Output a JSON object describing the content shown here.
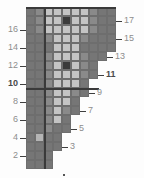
{
  "chart_data": {
    "type": "heatmap",
    "title": "",
    "xlabel": "",
    "ylabel": "",
    "grid": {
      "columns": 10,
      "rows": 18,
      "cell_px": 9,
      "origin_x": 26,
      "origin_y": 7
    },
    "palette": {
      "dark": "#3a3a3a",
      "mid_dark": "#767676",
      "mid": "#8a8a8a",
      "light": "#b4b4b4",
      "pale": "#c4c4c4",
      "empty": "#ffffff",
      "gridline": "#6e6e6e",
      "heavy_line": "#3a3a3a",
      "label": "#8d8d8d",
      "label_bold": "#4a4a4a"
    },
    "row_widths": [
      3,
      3,
      4,
      4,
      5,
      5,
      6,
      6,
      7,
      7,
      8,
      8,
      9,
      10,
      10,
      10,
      10,
      10
    ],
    "cells": [
      {
        "r": 18,
        "c": 1,
        "v": "mid_dark"
      },
      {
        "r": 18,
        "c": 2,
        "v": "mid"
      },
      {
        "r": 18,
        "c": 3,
        "v": "pale"
      },
      {
        "r": 18,
        "c": 4,
        "v": "pale"
      },
      {
        "r": 18,
        "c": 5,
        "v": "pale"
      },
      {
        "r": 18,
        "c": 6,
        "v": "pale"
      },
      {
        "r": 18,
        "c": 7,
        "v": "pale"
      },
      {
        "r": 18,
        "c": 8,
        "v": "mid"
      },
      {
        "r": 18,
        "c": 9,
        "v": "mid_dark"
      },
      {
        "r": 18,
        "c": 10,
        "v": "mid_dark"
      },
      {
        "r": 17,
        "c": 1,
        "v": "mid_dark"
      },
      {
        "r": 17,
        "c": 2,
        "v": "mid"
      },
      {
        "r": 17,
        "c": 3,
        "v": "pale"
      },
      {
        "r": 17,
        "c": 4,
        "v": "pale"
      },
      {
        "r": 17,
        "c": 5,
        "v": "dark"
      },
      {
        "r": 17,
        "c": 6,
        "v": "pale"
      },
      {
        "r": 17,
        "c": 7,
        "v": "pale"
      },
      {
        "r": 17,
        "c": 8,
        "v": "mid"
      },
      {
        "r": 17,
        "c": 9,
        "v": "mid_dark"
      },
      {
        "r": 17,
        "c": 10,
        "v": "mid_dark"
      },
      {
        "r": 16,
        "c": 1,
        "v": "mid_dark"
      },
      {
        "r": 16,
        "c": 2,
        "v": "mid"
      },
      {
        "r": 16,
        "c": 3,
        "v": "pale"
      },
      {
        "r": 16,
        "c": 4,
        "v": "pale"
      },
      {
        "r": 16,
        "c": 5,
        "v": "pale"
      },
      {
        "r": 16,
        "c": 6,
        "v": "pale"
      },
      {
        "r": 16,
        "c": 7,
        "v": "pale"
      },
      {
        "r": 16,
        "c": 8,
        "v": "mid"
      },
      {
        "r": 16,
        "c": 9,
        "v": "mid_dark"
      },
      {
        "r": 16,
        "c": 10,
        "v": "mid_dark"
      },
      {
        "r": 15,
        "c": 1,
        "v": "mid_dark"
      },
      {
        "r": 15,
        "c": 2,
        "v": "mid_dark"
      },
      {
        "r": 15,
        "c": 3,
        "v": "mid"
      },
      {
        "r": 15,
        "c": 4,
        "v": "pale"
      },
      {
        "r": 15,
        "c": 5,
        "v": "pale"
      },
      {
        "r": 15,
        "c": 6,
        "v": "pale"
      },
      {
        "r": 15,
        "c": 7,
        "v": "mid"
      },
      {
        "r": 15,
        "c": 8,
        "v": "mid_dark"
      },
      {
        "r": 15,
        "c": 9,
        "v": "mid_dark"
      },
      {
        "r": 15,
        "c": 10,
        "v": "mid_dark"
      },
      {
        "r": 14,
        "c": 1,
        "v": "mid_dark"
      },
      {
        "r": 14,
        "c": 2,
        "v": "mid_dark"
      },
      {
        "r": 14,
        "c": 3,
        "v": "mid_dark"
      },
      {
        "r": 14,
        "c": 4,
        "v": "pale"
      },
      {
        "r": 14,
        "c": 5,
        "v": "pale"
      },
      {
        "r": 14,
        "c": 6,
        "v": "pale"
      },
      {
        "r": 14,
        "c": 7,
        "v": "mid_dark"
      },
      {
        "r": 14,
        "c": 8,
        "v": "mid_dark"
      },
      {
        "r": 14,
        "c": 9,
        "v": "mid_dark"
      },
      {
        "r": 14,
        "c": 10,
        "v": "mid_dark"
      },
      {
        "r": 13,
        "c": 1,
        "v": "mid_dark"
      },
      {
        "r": 13,
        "c": 2,
        "v": "mid_dark"
      },
      {
        "r": 13,
        "c": 3,
        "v": "mid"
      },
      {
        "r": 13,
        "c": 4,
        "v": "pale"
      },
      {
        "r": 13,
        "c": 5,
        "v": "pale"
      },
      {
        "r": 13,
        "c": 6,
        "v": "pale"
      },
      {
        "r": 13,
        "c": 7,
        "v": "mid"
      },
      {
        "r": 13,
        "c": 8,
        "v": "mid_dark"
      },
      {
        "r": 13,
        "c": 9,
        "v": "mid_dark"
      },
      {
        "r": 12,
        "c": 1,
        "v": "mid_dark"
      },
      {
        "r": 12,
        "c": 2,
        "v": "mid_dark"
      },
      {
        "r": 12,
        "c": 3,
        "v": "mid"
      },
      {
        "r": 12,
        "c": 4,
        "v": "pale"
      },
      {
        "r": 12,
        "c": 5,
        "v": "dark"
      },
      {
        "r": 12,
        "c": 6,
        "v": "pale"
      },
      {
        "r": 12,
        "c": 7,
        "v": "mid"
      },
      {
        "r": 12,
        "c": 8,
        "v": "mid_dark"
      },
      {
        "r": 11,
        "c": 1,
        "v": "mid_dark"
      },
      {
        "r": 11,
        "c": 2,
        "v": "mid_dark"
      },
      {
        "r": 11,
        "c": 3,
        "v": "mid"
      },
      {
        "r": 11,
        "c": 4,
        "v": "pale"
      },
      {
        "r": 11,
        "c": 5,
        "v": "pale"
      },
      {
        "r": 11,
        "c": 6,
        "v": "pale"
      },
      {
        "r": 11,
        "c": 7,
        "v": "mid"
      },
      {
        "r": 11,
        "c": 8,
        "v": "mid_dark"
      },
      {
        "r": 10,
        "c": 1,
        "v": "mid_dark"
      },
      {
        "r": 10,
        "c": 2,
        "v": "mid_dark"
      },
      {
        "r": 10,
        "c": 3,
        "v": "mid"
      },
      {
        "r": 10,
        "c": 4,
        "v": "pale"
      },
      {
        "r": 10,
        "c": 5,
        "v": "pale"
      },
      {
        "r": 10,
        "c": 6,
        "v": "pale"
      },
      {
        "r": 10,
        "c": 7,
        "v": "mid_dark"
      },
      {
        "r": 9,
        "c": 1,
        "v": "mid_dark"
      },
      {
        "r": 9,
        "c": 2,
        "v": "mid_dark"
      },
      {
        "r": 9,
        "c": 3,
        "v": "mid"
      },
      {
        "r": 9,
        "c": 4,
        "v": "pale"
      },
      {
        "r": 9,
        "c": 5,
        "v": "pale"
      },
      {
        "r": 9,
        "c": 6,
        "v": "mid"
      },
      {
        "r": 9,
        "c": 7,
        "v": "mid_dark"
      },
      {
        "r": 8,
        "c": 1,
        "v": "mid_dark"
      },
      {
        "r": 8,
        "c": 2,
        "v": "mid_dark"
      },
      {
        "r": 8,
        "c": 3,
        "v": "mid"
      },
      {
        "r": 8,
        "c": 4,
        "v": "pale"
      },
      {
        "r": 8,
        "c": 5,
        "v": "pale"
      },
      {
        "r": 8,
        "c": 6,
        "v": "mid_dark"
      },
      {
        "r": 7,
        "c": 1,
        "v": "mid_dark"
      },
      {
        "r": 7,
        "c": 2,
        "v": "mid_dark"
      },
      {
        "r": 7,
        "c": 3,
        "v": "mid"
      },
      {
        "r": 7,
        "c": 4,
        "v": "pale"
      },
      {
        "r": 7,
        "c": 5,
        "v": "mid"
      },
      {
        "r": 7,
        "c": 6,
        "v": "mid_dark"
      },
      {
        "r": 6,
        "c": 1,
        "v": "mid_dark"
      },
      {
        "r": 6,
        "c": 2,
        "v": "mid_dark"
      },
      {
        "r": 6,
        "c": 3,
        "v": "mid"
      },
      {
        "r": 6,
        "c": 4,
        "v": "pale"
      },
      {
        "r": 6,
        "c": 5,
        "v": "mid_dark"
      },
      {
        "r": 5,
        "c": 1,
        "v": "mid_dark"
      },
      {
        "r": 5,
        "c": 2,
        "v": "mid_dark"
      },
      {
        "r": 5,
        "c": 3,
        "v": "mid"
      },
      {
        "r": 5,
        "c": 4,
        "v": "mid_dark"
      },
      {
        "r": 5,
        "c": 5,
        "v": "mid_dark"
      },
      {
        "r": 4,
        "c": 1,
        "v": "mid_dark"
      },
      {
        "r": 4,
        "c": 2,
        "v": "light"
      },
      {
        "r": 4,
        "c": 3,
        "v": "mid_dark"
      },
      {
        "r": 4,
        "c": 4,
        "v": "mid_dark"
      },
      {
        "r": 3,
        "c": 1,
        "v": "mid_dark"
      },
      {
        "r": 3,
        "c": 2,
        "v": "mid_dark"
      },
      {
        "r": 3,
        "c": 3,
        "v": "mid_dark"
      },
      {
        "r": 3,
        "c": 4,
        "v": "mid_dark"
      },
      {
        "r": 2,
        "c": 1,
        "v": "mid_dark"
      },
      {
        "r": 2,
        "c": 2,
        "v": "mid_dark"
      },
      {
        "r": 2,
        "c": 3,
        "v": "mid_dark"
      },
      {
        "r": 1,
        "c": 1,
        "v": "mid_dark"
      },
      {
        "r": 1,
        "c": 2,
        "v": "mid_dark"
      },
      {
        "r": 1,
        "c": 3,
        "v": "mid_dark"
      }
    ],
    "left_labels": [
      {
        "text": "16",
        "row": 16
      },
      {
        "text": "14",
        "row": 14
      },
      {
        "text": "12",
        "row": 12
      },
      {
        "text": "10",
        "row": 10,
        "bold": true
      },
      {
        "text": "8",
        "row": 8
      },
      {
        "text": "6",
        "row": 6
      },
      {
        "text": "4",
        "row": 4
      },
      {
        "text": "2",
        "row": 2
      }
    ],
    "right_labels": [
      {
        "text": "17",
        "row": 17
      },
      {
        "text": "15",
        "row": 15
      },
      {
        "text": "13",
        "row": 13
      },
      {
        "text": "11",
        "row": 11,
        "bold": true
      },
      {
        "text": "9",
        "row": 9
      },
      {
        "text": "7",
        "row": 7
      },
      {
        "text": "5",
        "row": 5
      },
      {
        "text": "3",
        "row": 3
      }
    ]
  }
}
